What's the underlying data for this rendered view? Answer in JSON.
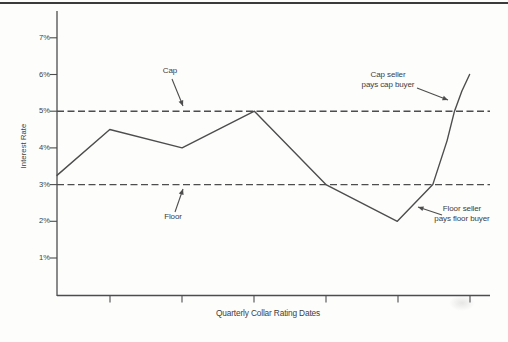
{
  "page": {
    "background": "#fdfdfc",
    "top_rule_color": "#3a3a3a",
    "line_color": "#4d4d4d",
    "text_color": "#3d3d3d"
  },
  "chart_data": {
    "type": "line",
    "title": "",
    "xlabel": "Quarterly Collar Rating Dates",
    "ylabel": "Interest Rate",
    "ylim": [
      0,
      7.7
    ],
    "grid": "off",
    "y_ticks": [
      {
        "label": "1%",
        "value": 1
      },
      {
        "label": "2%",
        "value": 2
      },
      {
        "label": "3%",
        "value": 3
      },
      {
        "label": "4%",
        "value": 4
      },
      {
        "label": "5%",
        "value": 5
      },
      {
        "label": "6%",
        "value": 6
      },
      {
        "label": "7%",
        "value": 7
      }
    ],
    "x_axis": {
      "num_unlabeled_ticks": 6,
      "tick_labels": []
    },
    "reference_lines": [
      {
        "name": "Cap",
        "value": 5,
        "style": "dashed"
      },
      {
        "name": "Floor",
        "value": 3,
        "style": "dashed"
      }
    ],
    "series": [
      {
        "name": "interest-rate-path",
        "x_units": "fraction of x-axis width",
        "y_units": "percent",
        "points": [
          {
            "x": 0.0,
            "y": 3.25
          },
          {
            "x": 0.122,
            "y": 4.5
          },
          {
            "x": 0.289,
            "y": 4.0
          },
          {
            "x": 0.456,
            "y": 5.0
          },
          {
            "x": 0.621,
            "y": 3.0
          },
          {
            "x": 0.786,
            "y": 2.0
          },
          {
            "x": 0.868,
            "y": 3.0
          },
          {
            "x": 0.901,
            "y": 4.2
          },
          {
            "x": 0.918,
            "y": 5.0
          },
          {
            "x": 0.935,
            "y": 5.55
          },
          {
            "x": 0.953,
            "y": 6.0
          }
        ],
        "values_at_quarterly_ticks": [
          4.5,
          4.0,
          5.0,
          3.0,
          2.0,
          6.0
        ]
      }
    ],
    "annotations": [
      {
        "id": "cap",
        "line1": "Cap",
        "line2": "",
        "target": "cap dashed line at 5%"
      },
      {
        "id": "floor",
        "line1": "Floor",
        "line2": "",
        "target": "floor dashed line at 3%"
      },
      {
        "id": "cap-seller",
        "line1": "Cap seller",
        "line2": "pays cap buyer",
        "target": "rate path crossing above the cap"
      },
      {
        "id": "floor-seller",
        "line1": "Floor seller",
        "line2": "pays floor buyer",
        "target": "rate path below the floor"
      }
    ]
  }
}
